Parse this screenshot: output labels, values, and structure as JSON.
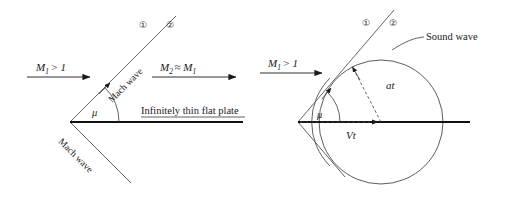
{
  "figure": {
    "background_color": "#ffffff",
    "line_color": "#1a1a1a",
    "wave_line_color": "#555555",
    "panels": [
      {
        "id": "left-panel",
        "name": "mach-wave-panel",
        "labels": {
          "inflow_mach": "M",
          "inflow_mach_sub": "1",
          "inflow_mach_rel": "> 1",
          "outflow_mach": "M",
          "outflow_mach_sub": "2",
          "outflow_mach_rel": "≈ M",
          "outflow_mach_rel_sub": "1",
          "region_one": "①",
          "region_two": "②",
          "mach_wave_upper": "Mach wave",
          "mach_wave_lower": "Mach wave",
          "mach_angle": "μ",
          "plate": "Infinitely thin flat plate"
        }
      },
      {
        "id": "right-panel",
        "name": "sound-wave-panel",
        "labels": {
          "inflow_mach": "M",
          "inflow_mach_sub": "1",
          "inflow_mach_rel": "> 1",
          "region_one": "①",
          "region_two": "②",
          "sound_wave": "Sound wave",
          "sound_radius": "at",
          "flow_distance": "Vt",
          "mach_angle": "μ"
        }
      }
    ]
  }
}
